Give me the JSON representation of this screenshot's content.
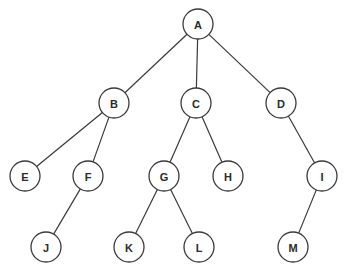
{
  "diagram": {
    "type": "tree",
    "root": "A",
    "nodes": [
      {
        "id": "A",
        "label": "A"
      },
      {
        "id": "B",
        "label": "B"
      },
      {
        "id": "C",
        "label": "C"
      },
      {
        "id": "D",
        "label": "D"
      },
      {
        "id": "E",
        "label": "E"
      },
      {
        "id": "F",
        "label": "F"
      },
      {
        "id": "G",
        "label": "G"
      },
      {
        "id": "H",
        "label": "H"
      },
      {
        "id": "I",
        "label": "I"
      },
      {
        "id": "J",
        "label": "J"
      },
      {
        "id": "K",
        "label": "K"
      },
      {
        "id": "L",
        "label": "L"
      },
      {
        "id": "M",
        "label": "M"
      }
    ],
    "edges": [
      {
        "from": "A",
        "to": "B"
      },
      {
        "from": "A",
        "to": "C"
      },
      {
        "from": "A",
        "to": "D"
      },
      {
        "from": "B",
        "to": "E"
      },
      {
        "from": "B",
        "to": "F"
      },
      {
        "from": "C",
        "to": "G"
      },
      {
        "from": "C",
        "to": "H"
      },
      {
        "from": "D",
        "to": "I"
      },
      {
        "from": "F",
        "to": "J"
      },
      {
        "from": "G",
        "to": "K"
      },
      {
        "from": "G",
        "to": "L"
      },
      {
        "from": "I",
        "to": "M"
      }
    ]
  }
}
